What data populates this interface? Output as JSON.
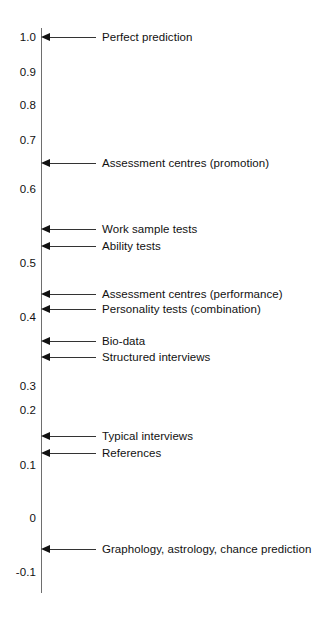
{
  "chart_data": {
    "type": "scatter",
    "title": "",
    "subtitle": "",
    "xlabel": "",
    "ylabel": "",
    "orientation": "vertical-single-axis",
    "grid": false,
    "legend": null,
    "axis": {
      "name": "validity-coefficient-axis",
      "ylim": [
        -0.1,
        1.0
      ],
      "tick_labels": [
        "1.0",
        "0.9",
        "0.8",
        "0.7",
        "0.6",
        "0.5",
        "0.4",
        "0.3",
        "0.2",
        "0.1",
        "0",
        "-0.1"
      ],
      "tick_values": [
        1.0,
        0.9,
        0.8,
        0.7,
        0.6,
        0.5,
        0.4,
        0.3,
        0.2,
        0.1,
        0,
        -0.1
      ],
      "tick_pixel_y": [
        37,
        72,
        105,
        140,
        189,
        263,
        317,
        386,
        410,
        465,
        518,
        572
      ]
    },
    "categories": [
      "Perfect prediction",
      "Assessment centres (promotion)",
      "Work sample tests",
      "Ability tests",
      "Assessment centres (performance)",
      "Personality tests (combination)",
      "Bio-data",
      "Structured interviews",
      "Typical interviews",
      "References",
      "Graphology, astrology, chance prediction"
    ],
    "values": [
      1.0,
      0.65,
      0.55,
      0.53,
      0.45,
      0.43,
      0.38,
      0.35,
      0.17,
      0.13,
      -0.05
    ],
    "annotations": [
      {
        "label": "Perfect prediction",
        "value": 1.0,
        "pixel_y": 37
      },
      {
        "label": "Assessment centres (promotion)",
        "value": 0.65,
        "pixel_y": 163
      },
      {
        "label": "Work sample tests",
        "value": 0.55,
        "pixel_y": 229
      },
      {
        "label": "Ability tests",
        "value": 0.53,
        "pixel_y": 246
      },
      {
        "label": "Assessment centres (performance)",
        "value": 0.45,
        "pixel_y": 294
      },
      {
        "label": "Personality tests (combination)",
        "value": 0.43,
        "pixel_y": 309
      },
      {
        "label": "Bio-data",
        "value": 0.38,
        "pixel_y": 341
      },
      {
        "label": "Structured interviews",
        "value": 0.35,
        "pixel_y": 357
      },
      {
        "label": "Typical interviews",
        "value": 0.17,
        "pixel_y": 436
      },
      {
        "label": "References",
        "value": 0.13,
        "pixel_y": 453
      },
      {
        "label": "Graphology, astrology, chance prediction",
        "value": -0.05,
        "pixel_y": 549
      }
    ]
  },
  "colors": {
    "background": "#ffffff",
    "axis": "#6e6e6e",
    "text": "#111111",
    "leader": "#333333"
  }
}
